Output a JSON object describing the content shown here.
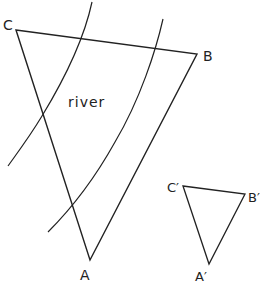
{
  "diagram": {
    "large_triangle": {
      "vertices": {
        "A": [
          90,
          260
        ],
        "B": [
          197,
          54
        ],
        "C": [
          16,
          30
        ]
      },
      "labels": {
        "A": "A",
        "B": "B",
        "C": "C"
      }
    },
    "small_triangle": {
      "vertices": {
        "A": [
          209,
          264
        ],
        "B": [
          245,
          194
        ],
        "C": [
          183,
          186
        ]
      },
      "labels": {
        "A": "A′",
        "B": "B′",
        "C": "C′"
      }
    },
    "river": {
      "label": "river",
      "left_bank": [
        [
          92,
          2
        ],
        [
          78,
          40
        ],
        [
          42,
          116
        ],
        [
          8,
          166
        ]
      ],
      "right_bank": [
        [
          163,
          19
        ],
        [
          152,
          47
        ],
        [
          115,
          142
        ],
        [
          48,
          232
        ]
      ]
    },
    "stroke_color": "#222222"
  }
}
